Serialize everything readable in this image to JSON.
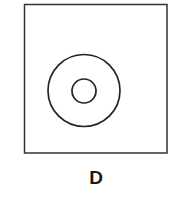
{
  "figure": {
    "label": "D",
    "frame": {
      "x": 24.5,
      "y": 4.5,
      "width": 142.5,
      "height": 148.5,
      "stroke": "#333333",
      "stroke_width": 1.5
    },
    "outer_circle": {
      "cx": 84,
      "cy": 90.5,
      "r": 36,
      "stroke": "#222222",
      "stroke_width": 1.7
    },
    "inner_circle": {
      "cx": 84,
      "cy": 91,
      "r": 12,
      "stroke": "#222222",
      "stroke_width": 1.7
    }
  }
}
